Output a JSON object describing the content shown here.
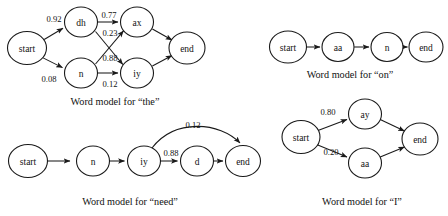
{
  "figure": {
    "background_color": "#ffffff",
    "ink_color": "#1a1a1a",
    "diagrams": [
      {
        "id": "word-model-the",
        "caption": "Word model for “the”",
        "caption_x": 115,
        "caption_y": 101,
        "nodes": [
          {
            "id": "start",
            "label": "start",
            "x": 27,
            "y": 48,
            "rx": 19.5,
            "ry": 16.5
          },
          {
            "id": "dh",
            "label": "dh",
            "x": 81,
            "y": 22,
            "rx": 16.5,
            "ry": 15.0
          },
          {
            "id": "ax",
            "label": "ax",
            "x": 137,
            "y": 22,
            "rx": 16.5,
            "ry": 15.0
          },
          {
            "id": "n",
            "label": "n",
            "x": 81,
            "y": 73,
            "rx": 16.5,
            "ry": 15.0
          },
          {
            "id": "iy",
            "label": "iy",
            "x": 137,
            "y": 73,
            "rx": 16.5,
            "ry": 15.0
          },
          {
            "id": "end",
            "label": "end",
            "x": 187,
            "y": 48,
            "rx": 18.0,
            "ry": 16.0
          }
        ],
        "edges": [
          {
            "from": "start",
            "to": "dh",
            "weight": "0.92",
            "label_x": 54,
            "label_y": 19
          },
          {
            "from": "start",
            "to": "n",
            "weight": "0.08",
            "label_x": 49,
            "label_y": 79
          },
          {
            "from": "dh",
            "to": "ax",
            "weight": "0.77",
            "label_x": 109,
            "label_y": 15
          },
          {
            "from": "dh",
            "to": "iy",
            "weight": "0.23",
            "label_x": 110,
            "label_y": 33
          },
          {
            "from": "n",
            "to": "ax",
            "weight": "0.88",
            "label_x": 110,
            "label_y": 58
          },
          {
            "from": "n",
            "to": "iy",
            "weight": "0.12",
            "label_x": 110,
            "label_y": 84
          },
          {
            "from": "ax",
            "to": "end",
            "weight": "",
            "label_x": 0,
            "label_y": 0
          },
          {
            "from": "iy",
            "to": "end",
            "weight": "",
            "label_x": 0,
            "label_y": 0
          }
        ]
      },
      {
        "id": "word-model-on",
        "caption": "Word model for “on”",
        "caption_x": 350,
        "caption_y": 74,
        "nodes": [
          {
            "id": "start",
            "label": "start",
            "x": 288,
            "y": 47,
            "rx": 18.5,
            "ry": 16.0
          },
          {
            "id": "aa",
            "label": "aa",
            "x": 338,
            "y": 47,
            "rx": 16.0,
            "ry": 14.5
          },
          {
            "id": "n",
            "label": "n",
            "x": 387,
            "y": 47,
            "rx": 16.0,
            "ry": 14.5
          },
          {
            "id": "end",
            "label": "end",
            "x": 426,
            "y": 47,
            "rx": 17.0,
            "ry": 15.0
          }
        ],
        "edges": [
          {
            "from": "start",
            "to": "aa",
            "weight": "",
            "label_x": 0,
            "label_y": 0
          },
          {
            "from": "aa",
            "to": "n",
            "weight": "",
            "label_x": 0,
            "label_y": 0
          },
          {
            "from": "n",
            "to": "end",
            "weight": "",
            "label_x": 0,
            "label_y": 0
          }
        ]
      },
      {
        "id": "word-model-need",
        "caption": "Word model for “need”",
        "caption_x": 130,
        "caption_y": 201,
        "nodes": [
          {
            "id": "start",
            "label": "start",
            "x": 28,
            "y": 161,
            "rx": 19.5,
            "ry": 16.5
          },
          {
            "id": "n",
            "label": "n",
            "x": 93,
            "y": 161,
            "rx": 16.5,
            "ry": 15.0
          },
          {
            "id": "iy",
            "label": "iy",
            "x": 144,
            "y": 161,
            "rx": 16.5,
            "ry": 15.0
          },
          {
            "id": "d",
            "label": "d",
            "x": 197,
            "y": 161,
            "rx": 16.5,
            "ry": 15.0
          },
          {
            "id": "end",
            "label": "end",
            "x": 243,
            "y": 161,
            "rx": 17.5,
            "ry": 15.5
          }
        ],
        "edges": [
          {
            "from": "start",
            "to": "n",
            "weight": "",
            "label_x": 0,
            "label_y": 0
          },
          {
            "from": "n",
            "to": "iy",
            "weight": "",
            "label_x": 0,
            "label_y": 0
          },
          {
            "from": "iy",
            "to": "d",
            "weight": "0.88",
            "label_x": 171,
            "label_y": 153
          },
          {
            "from": "d",
            "to": "end",
            "weight": "",
            "label_x": 0,
            "label_y": 0
          },
          {
            "from": "iy",
            "to": "end",
            "weight": "0.12",
            "label_x": 193,
            "label_y": 125
          }
        ]
      },
      {
        "id": "word-model-i",
        "caption": "Word model for “I”",
        "caption_x": 362,
        "caption_y": 201,
        "nodes": [
          {
            "id": "start",
            "label": "start",
            "x": 301,
            "y": 137,
            "rx": 19.0,
            "ry": 16.5
          },
          {
            "id": "ay",
            "label": "ay",
            "x": 365,
            "y": 114,
            "rx": 16.5,
            "ry": 15.0
          },
          {
            "id": "aa",
            "label": "aa",
            "x": 365,
            "y": 163,
            "rx": 16.5,
            "ry": 15.0
          },
          {
            "id": "end",
            "label": "end",
            "x": 420,
            "y": 139,
            "rx": 18.0,
            "ry": 16.0
          }
        ],
        "edges": [
          {
            "from": "start",
            "to": "ay",
            "weight": "0.80",
            "label_x": 328,
            "label_y": 112
          },
          {
            "from": "start",
            "to": "aa",
            "weight": "0.20",
            "label_x": 331,
            "label_y": 152
          },
          {
            "from": "ay",
            "to": "end",
            "weight": "",
            "label_x": 0,
            "label_y": 0
          },
          {
            "from": "aa",
            "to": "end",
            "weight": "",
            "label_x": 0,
            "label_y": 0
          }
        ]
      }
    ]
  }
}
